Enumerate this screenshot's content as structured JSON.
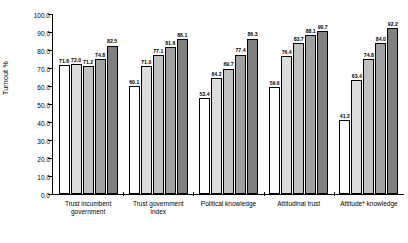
{
  "chart_data": {
    "type": "bar",
    "title": "",
    "xlabel": "",
    "ylabel": "Turnout %",
    "ylim": [
      0.0,
      100.0
    ],
    "ytick_labels": [
      "100.0",
      "90.0",
      "80.0",
      "70.0",
      "60.0",
      "50.0",
      "40.0",
      "30.0",
      "20.0",
      "10.0",
      "0.0"
    ],
    "ytick_values": [
      100,
      90,
      80,
      70,
      60,
      50,
      40,
      30,
      20,
      10,
      0
    ],
    "grid": false,
    "legend": "none",
    "categories": [
      "Trust incumbent government",
      "Trust government index",
      "Political knowledge",
      "Attitudinal trust",
      "Attitude* knowledge"
    ],
    "category_lines": [
      [
        "Trust incumbent",
        "government"
      ],
      [
        "Trust government",
        "index"
      ],
      [
        "Political knowledge"
      ],
      [
        "Attitudinal trust"
      ],
      [
        "Attitude* knowledge"
      ]
    ],
    "bar_colors": [
      "#ffffff",
      "#dcdcdc",
      "#c0c0c0",
      "#a0a0a0",
      "#808080"
    ],
    "groups": [
      {
        "name": "Trust incumbent government",
        "values": [
          71.6,
          72.0,
          71.2,
          74.8,
          82.5
        ],
        "labels": [
          "71.6",
          "72.0",
          "71.2",
          "74.8",
          "82.5"
        ]
      },
      {
        "name": "Trust government index",
        "values": [
          60.1,
          71.0,
          77.1,
          81.6,
          86.1
        ],
        "labels": [
          "60.1",
          "71.0",
          "77.1",
          "81.6",
          "86.1"
        ]
      },
      {
        "name": "Political knowledge",
        "values": [
          53.4,
          64.2,
          69.7,
          77.4,
          86.3
        ],
        "labels": [
          "53.4",
          "64.2",
          "69.7",
          "77.4",
          "86.3"
        ]
      },
      {
        "name": "Attitudinal trust",
        "values": [
          59.6,
          76.4,
          83.7,
          88.1,
          90.7
        ],
        "labels": [
          "59.6",
          "76.4",
          "83.7",
          "88.1",
          "90.7"
        ]
      },
      {
        "name": "Attitude* knowledge",
        "values": [
          41.2,
          63.4,
          74.8,
          84.0,
          92.2
        ],
        "labels": [
          "41.2",
          "63.4",
          "74.8",
          "84.0",
          "92.2"
        ]
      }
    ]
  }
}
